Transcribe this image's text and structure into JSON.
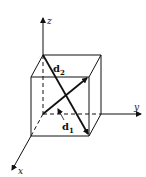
{
  "figure": {
    "type": "cube-with-axes",
    "axes": {
      "z": {
        "label": "z"
      },
      "y": {
        "label": "y"
      },
      "x": {
        "label": "x"
      }
    },
    "vectors": [
      {
        "name": "d2",
        "symbol": "d",
        "subscript": "2",
        "from": "back-top-left",
        "to": "front-bottom-right"
      },
      {
        "name": "d1",
        "symbol": "d",
        "subscript": "1",
        "from": "origin",
        "to": "front-top-right"
      }
    ],
    "colors": {
      "line": "#111111",
      "background": "#ffffff"
    }
  }
}
